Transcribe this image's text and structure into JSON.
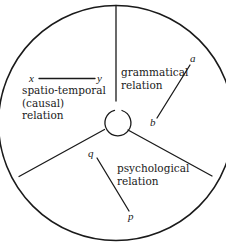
{
  "diagram": {
    "type": "circle-divided-into-three-sectors",
    "sectors": [
      {
        "id": "spatio-temporal",
        "label_lines": [
          "spatio-temporal",
          "(causal)",
          "relation"
        ],
        "terms": {
          "from": "x",
          "to": "y"
        }
      },
      {
        "id": "grammatical",
        "label_lines": [
          "grammatical",
          "relation"
        ],
        "terms": {
          "from": "a",
          "to": "b"
        }
      },
      {
        "id": "psychological",
        "label_lines": [
          "psychological",
          "relation"
        ],
        "terms": {
          "from": "q",
          "to": "p"
        }
      }
    ],
    "colors": {
      "ink": "#1a1a1a",
      "background": "#ffffff"
    }
  }
}
